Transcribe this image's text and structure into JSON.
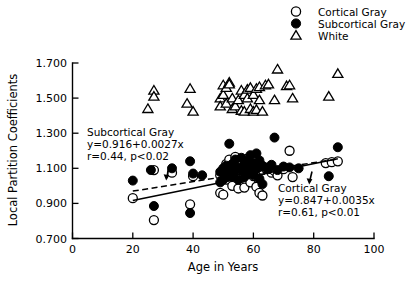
{
  "chart_data": {
    "type": "scatter",
    "title": "",
    "xlabel": "Age in Years",
    "ylabel": "Local Partition Coefficients",
    "xlim": [
      0,
      100
    ],
    "ylim": [
      0.7,
      1.7
    ],
    "xticks": [
      "0",
      "20",
      "40",
      "60",
      "80",
      "100"
    ],
    "yticks": [
      "0.700",
      "0.900",
      "1.100",
      "1.300",
      "1.500",
      "1.700"
    ],
    "grid": false,
    "legend_position": "top-right",
    "legend": [
      {
        "label": "Cortical Gray",
        "marker": "open-circle"
      },
      {
        "label": "Subcortical Gray",
        "marker": "filled-circle"
      },
      {
        "label": "White",
        "marker": "open-triangle"
      }
    ],
    "series": [
      {
        "name": "Cortical Gray",
        "marker": "open-circle",
        "points": [
          [
            20,
            0.93
          ],
          [
            27,
            1.09
          ],
          [
            27,
            0.805
          ],
          [
            33,
            1.075
          ],
          [
            39,
            0.895
          ],
          [
            40,
            1.055
          ],
          [
            49,
            1.06
          ],
          [
            49,
            0.96
          ],
          [
            50,
            1.075
          ],
          [
            50,
            0.95
          ],
          [
            51,
            1.125
          ],
          [
            51,
            1.035
          ],
          [
            52,
            1.15
          ],
          [
            52,
            1.07
          ],
          [
            53,
            1.095
          ],
          [
            53,
            1.0
          ],
          [
            54,
            1.165
          ],
          [
            54,
            1.08
          ],
          [
            55,
            1.11
          ],
          [
            55,
            0.985
          ],
          [
            56,
            1.13
          ],
          [
            56,
            1.045
          ],
          [
            57,
            1.1
          ],
          [
            57,
            0.99
          ],
          [
            58,
            1.155
          ],
          [
            58,
            1.065
          ],
          [
            59,
            1.11
          ],
          [
            59,
            1.02
          ],
          [
            60,
            1.14
          ],
          [
            60,
            1.055
          ],
          [
            61,
            1.105
          ],
          [
            61,
            0.995
          ],
          [
            62,
            1.12
          ],
          [
            62,
            0.96
          ],
          [
            63,
            1.09
          ],
          [
            63,
            0.945
          ],
          [
            64,
            1.1
          ],
          [
            66,
            1.075
          ],
          [
            67,
            1.085
          ],
          [
            68,
            1.06
          ],
          [
            70,
            1.095
          ],
          [
            72,
            1.2
          ],
          [
            73,
            1.05
          ],
          [
            84,
            1.13
          ],
          [
            86,
            1.135
          ],
          [
            88,
            1.14
          ]
        ]
      },
      {
        "name": "Subcortical Gray",
        "marker": "filled-circle",
        "points": [
          [
            20,
            1.03
          ],
          [
            26,
            1.09
          ],
          [
            27,
            0.885
          ],
          [
            33,
            1.1
          ],
          [
            39,
            1.14
          ],
          [
            39,
            0.845
          ],
          [
            40,
            1.07
          ],
          [
            43,
            1.06
          ],
          [
            49,
            1.08
          ],
          [
            49,
            1.02
          ],
          [
            50,
            1.1
          ],
          [
            50,
            1.035
          ],
          [
            51,
            1.115
          ],
          [
            51,
            1.05
          ],
          [
            52,
            1.24
          ],
          [
            52,
            1.09
          ],
          [
            53,
            1.125
          ],
          [
            53,
            1.055
          ],
          [
            54,
            1.15
          ],
          [
            54,
            1.085
          ],
          [
            55,
            1.105
          ],
          [
            55,
            1.035
          ],
          [
            56,
            1.16
          ],
          [
            56,
            1.095
          ],
          [
            57,
            1.12
          ],
          [
            57,
            1.05
          ],
          [
            58,
            1.14
          ],
          [
            58,
            1.075
          ],
          [
            59,
            1.175
          ],
          [
            59,
            1.1
          ],
          [
            60,
            1.13
          ],
          [
            60,
            1.06
          ],
          [
            61,
            1.185
          ],
          [
            61,
            1.095
          ],
          [
            62,
            1.145
          ],
          [
            62,
            1.04
          ],
          [
            63,
            1.115
          ],
          [
            63,
            1.01
          ],
          [
            64,
            1.105
          ],
          [
            65,
            1.095
          ],
          [
            66,
            1.12
          ],
          [
            67,
            1.275
          ],
          [
            68,
            1.09
          ],
          [
            70,
            1.11
          ],
          [
            72,
            1.105
          ],
          [
            75,
            1.1
          ],
          [
            85,
            1.055
          ],
          [
            88,
            1.22
          ]
        ]
      },
      {
        "name": "White",
        "marker": "open-triangle",
        "points": [
          [
            25,
            1.44
          ],
          [
            27,
            1.545
          ],
          [
            27,
            1.51
          ],
          [
            38,
            1.47
          ],
          [
            39,
            1.555
          ],
          [
            40,
            1.425
          ],
          [
            49,
            1.5
          ],
          [
            49,
            1.455
          ],
          [
            50,
            1.575
          ],
          [
            50,
            1.52
          ],
          [
            51,
            1.56
          ],
          [
            51,
            1.47
          ],
          [
            52,
            1.59
          ],
          [
            52,
            1.58
          ],
          [
            53,
            1.5
          ],
          [
            53,
            1.44
          ],
          [
            54,
            1.455
          ],
          [
            55,
            1.49
          ],
          [
            56,
            1.545
          ],
          [
            56,
            1.43
          ],
          [
            57,
            1.52
          ],
          [
            57,
            1.425
          ],
          [
            58,
            1.55
          ],
          [
            58,
            1.5
          ],
          [
            59,
            1.56
          ],
          [
            59,
            1.44
          ],
          [
            60,
            1.52
          ],
          [
            60,
            1.425
          ],
          [
            61,
            1.555
          ],
          [
            61,
            1.435
          ],
          [
            62,
            1.565
          ],
          [
            62,
            1.49
          ],
          [
            63,
            1.425
          ],
          [
            64,
            1.575
          ],
          [
            65,
            1.58
          ],
          [
            67,
            1.49
          ],
          [
            68,
            1.665
          ],
          [
            71,
            1.57
          ],
          [
            72,
            1.575
          ],
          [
            73,
            1.5
          ],
          [
            85,
            1.51
          ],
          [
            88,
            1.64
          ]
        ]
      }
    ],
    "fits": [
      {
        "name": "Subcortical Gray",
        "style": "dashed",
        "intercept": 0.916,
        "slope": 0.0027,
        "r": 0.44,
        "p": "<0.02",
        "x_range": [
          20,
          88
        ],
        "label_lines": [
          "Subcortical Gray",
          "y=0.916+0.0027x",
          "r=0.44, p<0.02"
        ]
      },
      {
        "name": "Cortical Gray",
        "style": "solid",
        "intercept": 0.847,
        "slope": 0.0035,
        "r": 0.61,
        "p": "<0.01",
        "x_range": [
          20,
          88
        ],
        "label_lines": [
          "Cortical Gray",
          "y=0.847+0.0035x",
          "r=0.61, p<0.01"
        ]
      }
    ]
  },
  "axes": {
    "y_title": "Local Partition Coefficients",
    "x_title": "Age in Years",
    "y_tick_labels": [
      "1.700",
      "1.500",
      "1.300",
      "1.100",
      "0.900",
      "0.700"
    ],
    "x_tick_labels": [
      "0",
      "20",
      "40",
      "60",
      "80",
      "100"
    ]
  },
  "legend": {
    "items": [
      {
        "label": "Cortical Gray"
      },
      {
        "label": "Subcortical Gray"
      },
      {
        "label": "White"
      }
    ]
  },
  "annotations": {
    "subcortical": {
      "line1": "Subcortical Gray",
      "line2": "y=0.916+0.0027x",
      "line3": "r=0.44, p<0.02"
    },
    "cortical": {
      "line1": "Cortical Gray",
      "line2": "y=0.847+0.0035x",
      "line3": "r=0.61, p<0.01"
    }
  }
}
